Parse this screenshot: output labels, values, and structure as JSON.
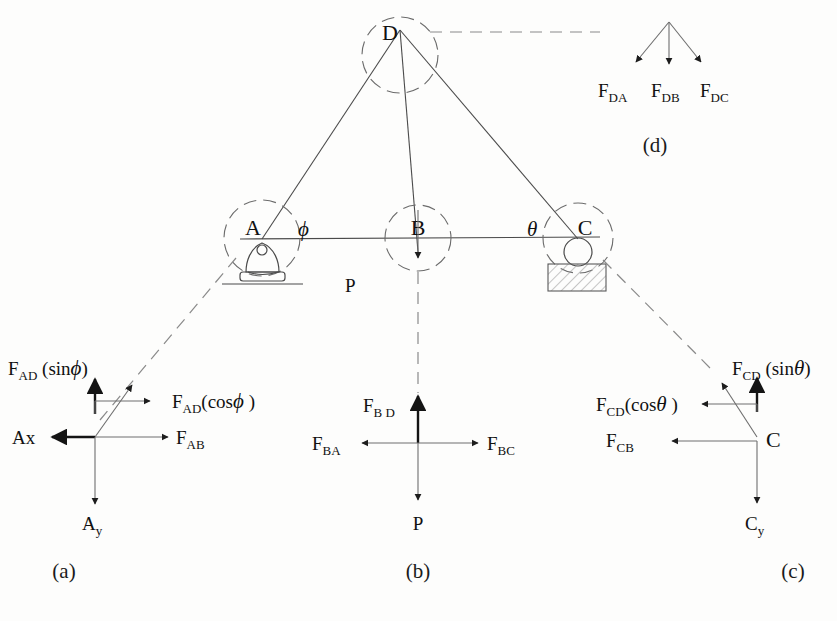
{
  "figure": {
    "type": "engineering-free-body-diagram"
  },
  "truss": {
    "joints": [
      {
        "id": "D",
        "label": "D",
        "x": 400,
        "y": 28
      },
      {
        "id": "A",
        "label": "A",
        "x": 262,
        "y": 238
      },
      {
        "id": "B",
        "label": "B",
        "x": 418,
        "y": 238
      },
      {
        "id": "C",
        "label": "C",
        "x": 578,
        "y": 238
      }
    ],
    "angles": {
      "phi": "ϕ",
      "theta": "θ"
    },
    "load_label": "P",
    "supports": {
      "a_type": "pin-support",
      "c_type": "roller-support"
    }
  },
  "panel_a": {
    "caption": "(a)",
    "joint_label": "",
    "forces": [
      {
        "name": "F_AD_sin_phi",
        "label": "F",
        "sub": "AD",
        "paren": " (sin",
        "greek": "ϕ",
        "close": ")",
        "dir": "up"
      },
      {
        "name": "F_AD_cos_phi",
        "label": "F",
        "sub": "AD",
        "paren": "(cos",
        "greek": "ϕ",
        "close": " )",
        "dir": "right"
      },
      {
        "name": "Ax",
        "label": "Ax",
        "dir": "left"
      },
      {
        "name": "F_AB",
        "label": "F",
        "sub": "AB",
        "dir": "right"
      },
      {
        "name": "Ay",
        "label": "A",
        "sub": "y",
        "dir": "down"
      }
    ],
    "text": {
      "f_ad_sin_main": "F",
      "f_ad_sin_sub": "AD",
      "f_ad_sin_open": " (sin",
      "f_ad_sin_greek": "ϕ",
      "f_ad_sin_close": ")",
      "f_ad_cos_main": "F",
      "f_ad_cos_sub": "AD",
      "f_ad_cos_open": "(cos",
      "f_ad_cos_greek": "ϕ",
      "f_ad_cos_close": " )",
      "ax": "Ax",
      "f_ab_main": "F",
      "f_ab_sub": "AB",
      "ay_main": "A",
      "ay_sub": "y"
    }
  },
  "panel_b": {
    "caption": "(b)",
    "text": {
      "f_bd_main": "F",
      "f_bd_sub": "B D",
      "f_ba_main": "F",
      "f_ba_sub": "BA",
      "f_bc_main": "F",
      "f_bc_sub": "BC",
      "p": "P"
    }
  },
  "panel_c": {
    "caption": "(c)",
    "text": {
      "f_cd_sin_main": "F",
      "f_cd_sin_sub": "CD",
      "f_cd_sin_open": " (sin",
      "f_cd_sin_greek": "θ",
      "f_cd_sin_close": ")",
      "f_cd_cos_main": "F",
      "f_cd_cos_sub": "CD",
      "f_cd_cos_open": "(cos",
      "f_cd_cos_greek": "θ",
      "f_cd_cos_close": " )",
      "f_cb_main": "F",
      "f_cb_sub": "CB",
      "c_joint": "C",
      "cy_main": "C",
      "cy_sub": "y"
    }
  },
  "panel_d": {
    "caption": "(d)",
    "text": {
      "f_da_main": "F",
      "f_da_sub": "DA",
      "f_db_main": "F",
      "f_db_sub": "DB",
      "f_dc_main": "F",
      "f_dc_sub": "DC"
    }
  },
  "colors": {
    "ink": "#111111",
    "line": "#4a4a4a",
    "faint": "#8a8a8a",
    "background": "#fdfdfc"
  }
}
